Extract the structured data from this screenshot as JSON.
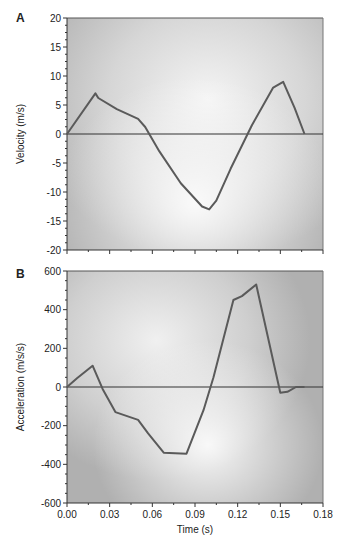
{
  "figure": {
    "panels": [
      "A",
      "B"
    ],
    "xlabel": "Time (s)"
  },
  "chart_data": [
    {
      "type": "line",
      "panel": "A",
      "title": "",
      "xlabel": "Time (s)",
      "ylabel": "Velocity (m/s)",
      "xlim": [
        0.0,
        0.18
      ],
      "ylim": [
        -20,
        20
      ],
      "xticks": [
        "0.00",
        "0.03",
        "0.06",
        "0.09",
        "0.12",
        "0.15",
        "0.18"
      ],
      "yticks": [
        "20",
        "15",
        "10",
        "5",
        "0",
        "-5",
        "-10",
        "-15",
        "-20"
      ],
      "grid": false,
      "zero_line": true,
      "series": [
        {
          "name": "Velocity",
          "x": [
            0.0,
            0.02,
            0.022,
            0.035,
            0.05,
            0.055,
            0.065,
            0.08,
            0.095,
            0.1,
            0.105,
            0.115,
            0.13,
            0.145,
            0.152,
            0.16,
            0.167
          ],
          "y": [
            0,
            7,
            6.2,
            4.3,
            2.6,
            1.2,
            -3,
            -8.5,
            -12.5,
            -13,
            -11.5,
            -6,
            1.5,
            8,
            9,
            4.5,
            0
          ]
        }
      ]
    },
    {
      "type": "line",
      "panel": "B",
      "title": "",
      "xlabel": "Time (s)",
      "ylabel": "Acceleration (m/s/s)",
      "xlim": [
        0.0,
        0.18
      ],
      "ylim": [
        -600,
        600
      ],
      "xticks": [
        "0.00",
        "0.03",
        "0.06",
        "0.09",
        "0.12",
        "0.15",
        "0.18"
      ],
      "yticks": [
        "600",
        "400",
        "200",
        "0",
        "-200",
        "-400",
        "-600"
      ],
      "grid": false,
      "zero_line": true,
      "series": [
        {
          "name": "Acceleration",
          "x": [
            0.0,
            0.007,
            0.018,
            0.025,
            0.034,
            0.05,
            0.057,
            0.068,
            0.084,
            0.096,
            0.103,
            0.117,
            0.123,
            0.133,
            0.15,
            0.155,
            0.161,
            0.167
          ],
          "y": [
            0,
            45,
            110,
            -10,
            -130,
            -170,
            -240,
            -340,
            -345,
            -120,
            50,
            450,
            470,
            530,
            -30,
            -25,
            0,
            0
          ]
        }
      ]
    }
  ]
}
